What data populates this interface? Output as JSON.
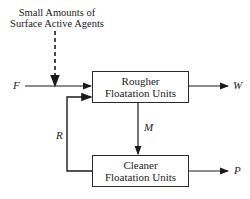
{
  "annotation": {
    "line1": "Small Amounts of",
    "line2": "Surface Active Agents"
  },
  "boxes": {
    "rougher": {
      "line1": "Rougher",
      "line2": "Floatation Units"
    },
    "cleaner": {
      "line1": "Cleaner",
      "line2": "Floatation Units"
    }
  },
  "streams": {
    "feed": "F",
    "waste": "W",
    "middle": "M",
    "recycle": "R",
    "product": "P"
  }
}
